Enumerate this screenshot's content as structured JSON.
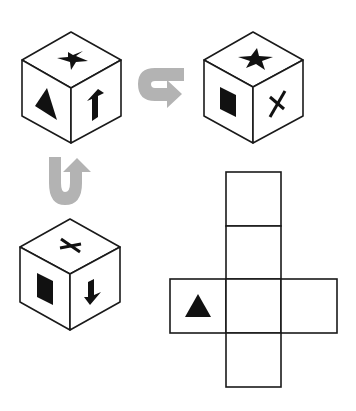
{
  "puzzle": {
    "type": "cube-net-folding",
    "cubes": [
      {
        "id": "cube-1",
        "faces": {
          "top": "star",
          "left": "triangle",
          "right": "arrow-up"
        }
      },
      {
        "id": "cube-2",
        "faces": {
          "top": "star",
          "left": "filled-square",
          "right": "x-cross"
        }
      },
      {
        "id": "cube-3",
        "faces": {
          "top": "x-cross",
          "left": "filled-square",
          "right": "arrow-down"
        }
      }
    ],
    "rotations": [
      {
        "from": "cube-1",
        "to": "cube-2",
        "icon": "u-turn-arrow-right",
        "color": "#b3b3b3"
      },
      {
        "from": "cube-3",
        "to": "cube-1",
        "icon": "u-turn-arrow-up",
        "color": "#b3b3b3"
      }
    ],
    "net": {
      "layout": "cross",
      "cells": [
        {
          "row": 0,
          "col": 1,
          "symbol": ""
        },
        {
          "row": 1,
          "col": 1,
          "symbol": ""
        },
        {
          "row": 2,
          "col": 0,
          "symbol": "triangle"
        },
        {
          "row": 2,
          "col": 1,
          "symbol": ""
        },
        {
          "row": 2,
          "col": 2,
          "symbol": ""
        },
        {
          "row": 3,
          "col": 1,
          "symbol": ""
        }
      ]
    }
  },
  "colors": {
    "line": "#1a1a1a",
    "symbol": "#111111",
    "arrow": "#b3b3b3",
    "background": "#ffffff"
  }
}
